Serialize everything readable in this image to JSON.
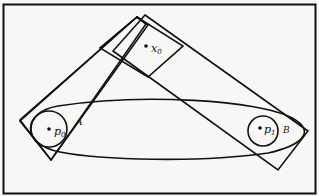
{
  "diagram": {
    "points": [
      {
        "id": "x0",
        "name": "x",
        "sub": "0",
        "cx": 146,
        "cy": 46
      },
      {
        "id": "p0",
        "name": "p",
        "sub": "0",
        "cx": 49,
        "cy": 129
      },
      {
        "id": "p1",
        "name": "p",
        "sub": "1",
        "cx": 260,
        "cy": 128
      }
    ],
    "region_labels": [
      {
        "id": "A",
        "text": "A",
        "x": 76,
        "y": 125
      },
      {
        "id": "B",
        "text": "B",
        "x": 283,
        "y": 131
      }
    ],
    "colors": {
      "ink": "#111111",
      "background": "#f7f7f5"
    }
  }
}
